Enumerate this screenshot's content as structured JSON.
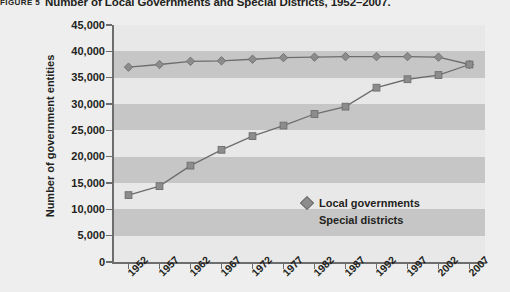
{
  "figure": {
    "label": "FIGURE 5",
    "title": "Number of Local Governments and Special Districts, 1952–2007."
  },
  "chart_data": {
    "type": "line",
    "title": "Number of Local Governments and Special Districts, 1952–2007.",
    "xlabel": "",
    "ylabel": "Number of government entities",
    "categories": [
      "1952",
      "1957",
      "1962",
      "1967",
      "1972",
      "1977",
      "1982",
      "1987",
      "1992",
      "1997",
      "2002",
      "2007"
    ],
    "x": [
      1952,
      1957,
      1962,
      1967,
      1972,
      1977,
      1982,
      1987,
      1992,
      1997,
      2002,
      2007
    ],
    "series": [
      {
        "name": "Local governments",
        "marker": "diamond",
        "values": [
          37000,
          37500,
          38100,
          38200,
          38500,
          38800,
          38900,
          39000,
          39000,
          39000,
          38900,
          37500
        ]
      },
      {
        "name": "Special districts",
        "marker": "square",
        "values": [
          12700,
          14400,
          18300,
          21300,
          23900,
          25900,
          28100,
          29500,
          33100,
          34700,
          35500,
          37500
        ]
      }
    ],
    "ylim": [
      0,
      45000
    ],
    "yticks": [
      0,
      5000,
      10000,
      15000,
      20000,
      25000,
      30000,
      35000,
      40000,
      45000
    ],
    "ytick_labels": [
      "0",
      "5,000",
      "10,000",
      "15,000",
      "20,000",
      "25,000",
      "30,000",
      "35,000",
      "40,000",
      "45,000"
    ],
    "grid": "horizontal alternating bands",
    "legend_position": "inside center-right",
    "colors": {
      "plot_background": "#e8e8e8",
      "band": "#c6c6c6",
      "page_background": "#eeeeee",
      "line": "#6d6d6d",
      "marker_fill": "#8c8c8c",
      "axis": "#6d6d6d",
      "text": "#231f20"
    }
  },
  "legend": {
    "items": [
      {
        "label": "Local governments",
        "marker": "diamond"
      },
      {
        "label": "Special districts",
        "marker": "none"
      }
    ]
  }
}
